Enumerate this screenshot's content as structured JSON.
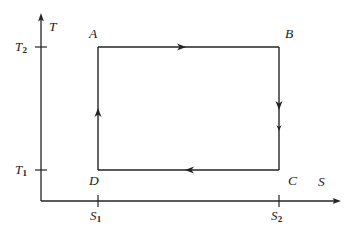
{
  "diagram": {
    "type": "thermodynamic-cycle-ts-diagram",
    "background_color": "#ffffff",
    "line_color": "#242424",
    "axes": {
      "y_label": "T",
      "x_label": "S",
      "y_ticks": [
        {
          "label": "T",
          "sub": "1"
        },
        {
          "label": "T",
          "sub": "2"
        }
      ],
      "x_ticks": [
        {
          "label": "S",
          "sub": "1"
        },
        {
          "label": "S",
          "sub": "2"
        }
      ]
    },
    "vertices": [
      {
        "name": "A",
        "position": "top-left"
      },
      {
        "name": "B",
        "position": "top-right"
      },
      {
        "name": "C",
        "position": "bottom-right"
      },
      {
        "name": "D",
        "position": "bottom-left"
      }
    ],
    "process_arrows": [
      {
        "edge": "top",
        "direction": "right"
      },
      {
        "edge": "right",
        "direction": "down"
      },
      {
        "edge": "bottom",
        "direction": "left"
      },
      {
        "edge": "left",
        "direction": "up"
      }
    ]
  }
}
